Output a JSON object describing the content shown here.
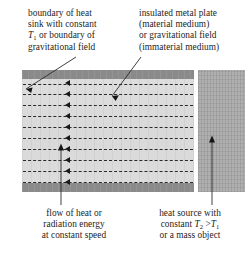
{
  "figure": {
    "type": "physics-schematic",
    "colors": {
      "boundary_band": "#8e8e8e",
      "medium_fill": "#d9d9d9",
      "heat_source_block": "#a8a8a8",
      "flow_line": "#2a2a2a",
      "text": "#1c1c1c"
    }
  },
  "labels": {
    "heat_sink": {
      "name": "boundary-of-heat-sink",
      "line1": "boundary of heat",
      "line2": "sink with constant",
      "line3_pre": "T",
      "line3_sub": "1",
      "line3_post": " or boundary of",
      "line4": "gravitational field"
    },
    "metal_plate": {
      "name": "insulated-metal-plate",
      "line1": "insulated metal plate",
      "line2": "(material medium)",
      "line3": "or gravitational field",
      "line4": "(immaterial medium)"
    },
    "energy_flow": {
      "name": "flow-of-heat-or-radiation-energy",
      "line1": "flow of heat or",
      "line2": "radiation energy",
      "line3": "at constant speed"
    },
    "heat_source": {
      "name": "heat-source-with-constant-temperature",
      "line1": "heat source with",
      "line2_pre": "constant ",
      "line2_t2": "T",
      "line2_t2_sub": "2",
      "line2_gt": " >",
      "line2_t1": "T",
      "line2_t1_sub": "1",
      "line3": "or a mass object"
    }
  },
  "diagram": {
    "flow_rows": 10,
    "flow_direction": "leftward",
    "boundary_bands": 2,
    "heat_source_side": "right"
  }
}
